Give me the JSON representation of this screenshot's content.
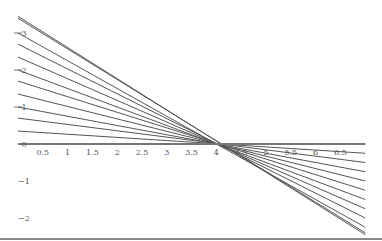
{
  "chart_data": {
    "type": "line",
    "title": "",
    "xlabel": "",
    "ylabel": "",
    "xlim": [
      0,
      7
    ],
    "ylim": [
      -2.3,
      3.9
    ],
    "grid": false,
    "legend": null,
    "pivot": [
      4,
      0
    ],
    "x_ticks": [
      0.5,
      1,
      1.5,
      2,
      2.5,
      3,
      3.5,
      4,
      4.5,
      5,
      5.5,
      6,
      6.5
    ],
    "x_tick_labels": [
      "0.5",
      "1",
      "1.5",
      "2",
      "2.5",
      "3",
      "3.5",
      "4",
      "4.5",
      "5",
      "5.5",
      "6",
      "6.5"
    ],
    "y_ticks": [
      -2,
      -1,
      0,
      1,
      2,
      3
    ],
    "y_tick_labels": [
      "−2",
      "−1",
      "0",
      "1",
      "2",
      "3"
    ],
    "x": [
      0,
      7
    ],
    "series": [
      {
        "name": "line-1",
        "values": [
          3.45,
          -2.45
        ]
      },
      {
        "name": "line-2",
        "values": [
          3.4,
          -2.4
        ]
      },
      {
        "name": "line-3",
        "values": [
          3.0,
          -2.25
        ]
      },
      {
        "name": "line-4",
        "values": [
          2.7,
          -2.0
        ]
      },
      {
        "name": "line-5",
        "values": [
          2.35,
          -1.75
        ]
      },
      {
        "name": "line-6",
        "values": [
          2.0,
          -1.5
        ]
      },
      {
        "name": "line-7",
        "values": [
          1.7,
          -1.25
        ]
      },
      {
        "name": "line-8",
        "values": [
          1.35,
          -1.0
        ]
      },
      {
        "name": "line-9",
        "values": [
          1.0,
          -0.75
        ]
      },
      {
        "name": "line-10",
        "values": [
          0.7,
          -0.5
        ]
      },
      {
        "name": "line-11",
        "values": [
          0.35,
          -0.25
        ]
      },
      {
        "name": "line-12",
        "values": [
          0.0,
          0.0
        ]
      }
    ],
    "line_color": "#555555"
  }
}
